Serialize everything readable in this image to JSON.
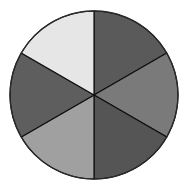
{
  "diagram": {
    "type": "pie-circle",
    "center": [
      94,
      95
    ],
    "radius": 84,
    "border_color": "#2a2a2a",
    "divider_color": "#111111",
    "sectors": [
      {
        "name": "top-right",
        "start_deg": 0,
        "end_deg": 60,
        "color": "#5a5a5a"
      },
      {
        "name": "right",
        "start_deg": 60,
        "end_deg": 120,
        "color": "#7a7a7a"
      },
      {
        "name": "bottom-right",
        "start_deg": 120,
        "end_deg": 180,
        "color": "#555555"
      },
      {
        "name": "bottom-left",
        "start_deg": 180,
        "end_deg": 240,
        "color": "#a0a0a0"
      },
      {
        "name": "left",
        "start_deg": 240,
        "end_deg": 300,
        "color": "#5e5e5e"
      },
      {
        "name": "top-left",
        "start_deg": 300,
        "end_deg": 360,
        "color": "#e6e6e6"
      }
    ]
  },
  "chart_data": {
    "type": "pie",
    "categories": [
      "Sector 1",
      "Sector 2",
      "Sector 3",
      "Sector 4",
      "Sector 5",
      "Sector 6"
    ],
    "values": [
      1,
      1,
      1,
      1,
      1,
      1
    ],
    "colors": [
      "#5a5a5a",
      "#7a7a7a",
      "#555555",
      "#a0a0a0",
      "#5e5e5e",
      "#e6e6e6"
    ],
    "title": "",
    "legend": false
  }
}
